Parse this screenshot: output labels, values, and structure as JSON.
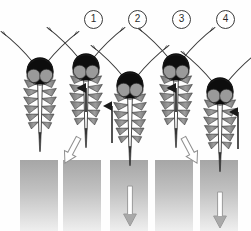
{
  "figure": {
    "type": "scientific-line-diagram",
    "canvas": {
      "width": 251,
      "height": 231,
      "background": "#ffffff"
    },
    "palette": {
      "head_top": "#0d0d0d",
      "eye_gray": "#9a9a9a",
      "maxilla_gray": "#8c8c8c",
      "maxilla_dark": "#4a4a4a",
      "outline": "#2a2a2a",
      "skin_top": "#a8a8a8",
      "skin_bottom": "#e8e8e8",
      "arrow_black": "#1a1a1a",
      "arrow_white_fill": "#ffffff",
      "arrow_white_stroke": "#8f8f8f",
      "arrow_gray": "#8a8a8a"
    },
    "step_labels": [
      {
        "id": "step-1",
        "text": "①",
        "digit": "1",
        "x": 84,
        "y": 10
      },
      {
        "id": "step-2",
        "text": "②",
        "digit": "2",
        "x": 128,
        "y": 10
      },
      {
        "id": "step-3",
        "text": "③",
        "digit": "3",
        "x": 172,
        "y": 10
      },
      {
        "id": "step-4",
        "text": "④",
        "digit": "4",
        "x": 216,
        "y": 10
      }
    ],
    "panels": [
      {
        "id": "panel-0",
        "name": "resting-position",
        "head_cx": 40,
        "head_cy": 72,
        "skin": {
          "x": 20,
          "y": 160,
          "w": 38,
          "h": 71
        },
        "arrows": []
      },
      {
        "id": "panel-1",
        "name": "maxillae-retract-labium-buckles",
        "head_cx": 86,
        "head_cy": 68,
        "skin": {
          "x": 63,
          "y": 160,
          "w": 38,
          "h": 71
        },
        "arrows": [
          {
            "kind": "black-up",
            "x": 86,
            "y1": 110,
            "y2": 86
          },
          {
            "kind": "white-down-left",
            "x": 70,
            "y": 152,
            "angle": 30
          }
        ]
      },
      {
        "id": "panel-2",
        "name": "head-descends-fascicle-penetrates",
        "head_cx": 130,
        "head_cy": 86,
        "skin": {
          "x": 110,
          "y": 160,
          "w": 38,
          "h": 71
        },
        "arrows": [
          {
            "kind": "black-up-offset",
            "x": 112,
            "y1": 142,
            "y2": 104
          },
          {
            "kind": "white-down-long",
            "x": 130,
            "y1": 190,
            "y2": 226
          }
        ]
      },
      {
        "id": "panel-3",
        "name": "maxillae-retract-again",
        "head_cx": 176,
        "head_cy": 68,
        "skin": {
          "x": 155,
          "y": 160,
          "w": 38,
          "h": 71
        },
        "arrows": [
          {
            "kind": "black-up",
            "x": 176,
            "y1": 110,
            "y2": 86
          },
          {
            "kind": "white-down-right",
            "x": 190,
            "y": 152,
            "angle": -30
          }
        ]
      },
      {
        "id": "panel-4",
        "name": "deeper-penetration",
        "head_cx": 220,
        "head_cy": 92,
        "skin": {
          "x": 200,
          "y": 160,
          "w": 38,
          "h": 71
        },
        "arrows": [
          {
            "kind": "black-up-offset",
            "x": 238,
            "y1": 148,
            "y2": 110
          },
          {
            "kind": "white-down-long",
            "x": 220,
            "y1": 196,
            "y2": 228
          }
        ]
      }
    ]
  }
}
